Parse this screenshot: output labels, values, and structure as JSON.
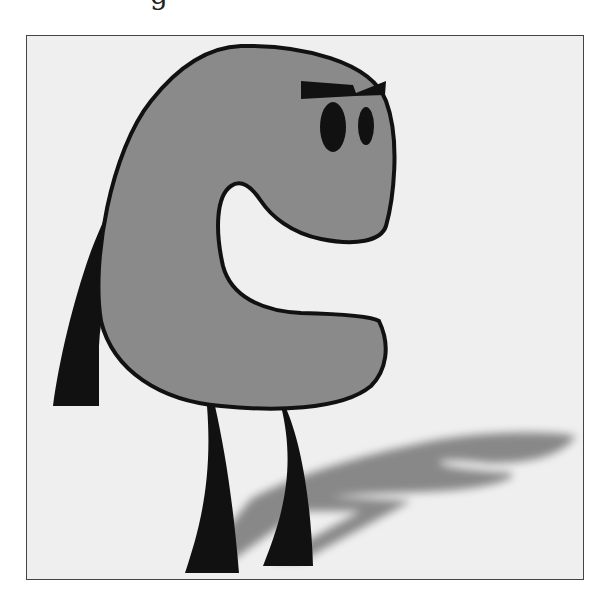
{
  "image": {
    "description": "Cartoon illustration of a gray C-shaped creature with two black eyes, angry eyebrow, a black arm on its back, two black legs, and a soft gray shadow cast to the right, inside a thin framed box",
    "top_partial_text": "g",
    "colors": {
      "background": "#efefef",
      "frame": "#444444",
      "body": "#8a8a8a",
      "outline": "#111111",
      "limbs": "#111111",
      "shadow": "#7a7a7a"
    }
  }
}
